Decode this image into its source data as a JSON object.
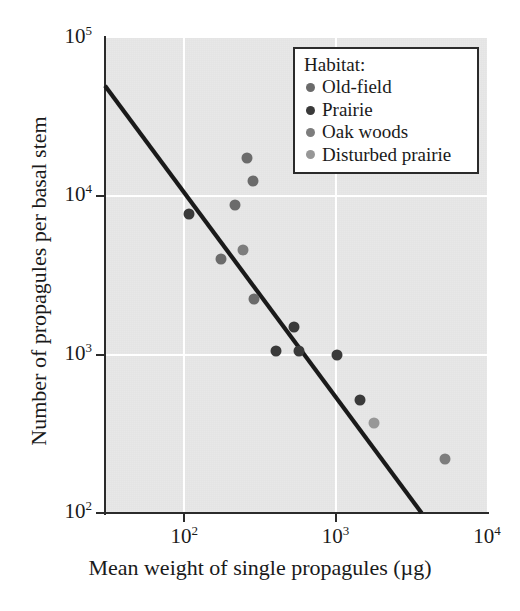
{
  "chart_data": {
    "type": "scatter",
    "title": "",
    "xlabel": "Mean weight of single propagules (µg)",
    "ylabel": "Number of propagules per basal stem",
    "xscale": "log",
    "yscale": "log",
    "xlim": [
      30,
      10000
    ],
    "ylim": [
      100,
      100000
    ],
    "grid": true,
    "legend_position": "top-right",
    "legend_title": "Habitat:",
    "xticks": [
      {
        "value": 100,
        "label": "10",
        "exponent": "2"
      },
      {
        "value": 1000,
        "label": "10",
        "exponent": "3"
      },
      {
        "value": 10000,
        "label": "10",
        "exponent": "4"
      }
    ],
    "yticks": [
      {
        "value": 100000,
        "label": "10",
        "exponent": "5"
      },
      {
        "value": 10000,
        "label": "10",
        "exponent": "4"
      },
      {
        "value": 1000,
        "label": "10",
        "exponent": "3"
      },
      {
        "value": 100,
        "label": "10",
        "exponent": "2"
      }
    ],
    "series": [
      {
        "name": "Old-field",
        "color": "#6b6b6b",
        "points": [
          {
            "x": 260,
            "y": 17500
          },
          {
            "x": 285,
            "y": 12500
          },
          {
            "x": 215,
            "y": 8800
          },
          {
            "x": 175,
            "y": 4000
          },
          {
            "x": 290,
            "y": 2250
          }
        ]
      },
      {
        "name": "Prairie",
        "color": "#3a3a3a",
        "points": [
          {
            "x": 108,
            "y": 7700
          },
          {
            "x": 530,
            "y": 1500
          },
          {
            "x": 405,
            "y": 1060
          },
          {
            "x": 570,
            "y": 1060
          },
          {
            "x": 1020,
            "y": 1000
          },
          {
            "x": 1450,
            "y": 520
          }
        ]
      },
      {
        "name": "Oak woods",
        "color": "#7d7d7d",
        "points": [
          {
            "x": 245,
            "y": 4600
          },
          {
            "x": 5300,
            "y": 220
          }
        ]
      },
      {
        "name": "Disturbed prairie",
        "color": "#979797",
        "points": [
          {
            "x": 1800,
            "y": 370
          }
        ]
      }
    ],
    "trend_line": {
      "name": "fitted regression line",
      "color": "#1a1a1a",
      "start": {
        "x": 30,
        "y": 50000
      },
      "end": {
        "x": 3700,
        "y": 100
      }
    },
    "annotations": []
  },
  "legend": {
    "title": "Habitat:",
    "entries": [
      {
        "label": "Old-field",
        "color": "#6b6b6b"
      },
      {
        "label": "Prairie",
        "color": "#3a3a3a"
      },
      {
        "label": "Oak woods",
        "color": "#7d7d7d"
      },
      {
        "label": "Disturbed prairie",
        "color": "#979797"
      }
    ]
  },
  "axes": {
    "x_title": "Mean weight of single propagules (µg)",
    "y_title": "Number of propagules per basal stem",
    "x_tick_labels": [
      "10",
      "10",
      "10"
    ],
    "x_tick_exponents": [
      "2",
      "3",
      "4"
    ],
    "y_tick_labels": [
      "10",
      "10",
      "10",
      "10"
    ],
    "y_tick_exponents": [
      "5",
      "4",
      "3",
      "2"
    ]
  },
  "colors": {
    "plot_background": "#e8e8e8",
    "page_background": "#ffffff",
    "axis": "#2b2b2b",
    "gridline": "#ffffff",
    "trend_line": "#1a1a1a"
  }
}
